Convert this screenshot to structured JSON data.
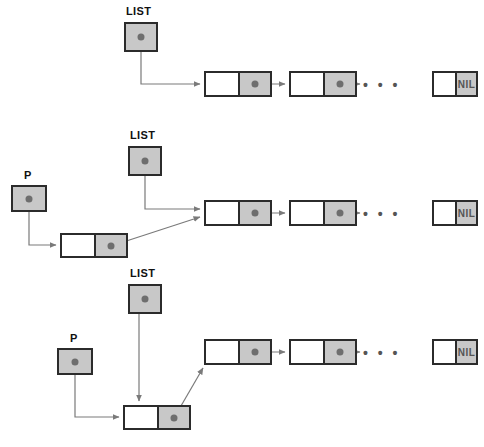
{
  "figure": {
    "caption": ""
  },
  "colors": {
    "box_fill_gray": "#c8c8c8",
    "box_fill_white": "#ffffff",
    "border": "#2b2b2b",
    "dot": "#6e6e6e",
    "arrow": "#7a7a7a",
    "nil_text": "#555555",
    "background": "#ffffff"
  },
  "labels": {
    "list": "LIST",
    "p": "P",
    "nil": "NIL",
    "ellipsis": "• • •"
  },
  "stages": [
    {
      "id": "stage-1",
      "name": "initial-list",
      "description": "LIST points to the first node of an existing chain; P does not exist yet.",
      "variables": [
        {
          "name": "LIST",
          "label": "LIST",
          "x": 124,
          "y": 22,
          "w": 34,
          "h": 30,
          "label_x": 126,
          "label_y": 5
        }
      ],
      "cells": [
        {
          "name": "chain-node-1",
          "x": 204,
          "y": 71,
          "w": 68,
          "h": 26,
          "link": "pointer"
        },
        {
          "name": "chain-node-2",
          "x": 289,
          "y": 71,
          "w": 68,
          "h": 26,
          "link": "pointer"
        },
        {
          "name": "chain-tail-nil",
          "x": 432,
          "y": 71,
          "w": 46,
          "h": 26,
          "link": "nil"
        }
      ],
      "ellipsis": {
        "x": 363,
        "y": 77
      }
    },
    {
      "id": "stage-2",
      "name": "new-node-allocated",
      "description": "P points to a newly allocated node whose link field points to the first node of the list; LIST still points to the first node.",
      "variables": [
        {
          "name": "LIST",
          "label": "LIST",
          "x": 128,
          "y": 146,
          "w": 34,
          "h": 30,
          "label_x": 130,
          "label_y": 129
        },
        {
          "name": "P",
          "label": "P",
          "x": 11,
          "y": 185,
          "w": 36,
          "h": 27,
          "label_x": 24,
          "label_y": 169
        }
      ],
      "cells": [
        {
          "name": "new-node",
          "x": 60,
          "y": 233,
          "w": 68,
          "h": 25,
          "link": "pointer"
        },
        {
          "name": "chain-node-1",
          "x": 204,
          "y": 200,
          "w": 68,
          "h": 26,
          "link": "pointer"
        },
        {
          "name": "chain-node-2",
          "x": 289,
          "y": 200,
          "w": 68,
          "h": 26,
          "link": "pointer"
        },
        {
          "name": "chain-tail-nil",
          "x": 432,
          "y": 200,
          "w": 46,
          "h": 26,
          "link": "nil"
        }
      ],
      "ellipsis": {
        "x": 363,
        "y": 206
      }
    },
    {
      "id": "stage-3",
      "name": "list-updated",
      "description": "LIST is reassigned to the new node, which becomes the head of the chain.",
      "variables": [
        {
          "name": "LIST",
          "label": "LIST",
          "x": 128,
          "y": 284,
          "w": 34,
          "h": 30,
          "label_x": 130,
          "label_y": 267
        },
        {
          "name": "P",
          "label": "P",
          "x": 57,
          "y": 348,
          "w": 36,
          "h": 27,
          "label_x": 70,
          "label_y": 332
        }
      ],
      "cells": [
        {
          "name": "new-head-node",
          "x": 123,
          "y": 405,
          "w": 68,
          "h": 25,
          "link": "pointer"
        },
        {
          "name": "chain-node-1",
          "x": 204,
          "y": 339,
          "w": 68,
          "h": 26,
          "link": "pointer"
        },
        {
          "name": "chain-node-2",
          "x": 289,
          "y": 339,
          "w": 68,
          "h": 26,
          "link": "pointer"
        },
        {
          "name": "chain-tail-nil",
          "x": 432,
          "y": 339,
          "w": 46,
          "h": 26,
          "link": "nil"
        }
      ],
      "ellipsis": {
        "x": 363,
        "y": 345
      }
    }
  ],
  "edges": [
    {
      "name": "stage1-list-to-node1",
      "stage": "stage-1",
      "from": "LIST",
      "to": "chain-node-1",
      "path": "M 141,52 L 141,84 L 200,84",
      "arrow": true
    },
    {
      "name": "stage1-node1-to-node2",
      "stage": "stage-1",
      "from": "chain-node-1",
      "to": "chain-node-2",
      "path": "M 238,84 L 285,84",
      "arrow": true
    },
    {
      "name": "stage1-node2-to-ellipsis",
      "stage": "stage-1",
      "from": "chain-node-2",
      "to": "ellipsis",
      "path": "M 323,84 L 360,84",
      "arrow": true
    },
    {
      "name": "stage2-list-to-node1",
      "stage": "stage-2",
      "from": "LIST",
      "to": "chain-node-1",
      "path": "M 145,176 L 145,209 L 200,209",
      "arrow": true
    },
    {
      "name": "stage2-p-to-newnode",
      "stage": "stage-2",
      "from": "P",
      "to": "new-node",
      "path": "M 29,212 L 29,245 L 56,245",
      "arrow": true
    },
    {
      "name": "stage2-newnode-to-node1",
      "stage": "stage-2",
      "from": "new-node",
      "to": "chain-node-1",
      "path": "M 111,246 L 200,217",
      "arrow": true
    },
    {
      "name": "stage2-node1-to-node2",
      "stage": "stage-2",
      "from": "chain-node-1",
      "to": "chain-node-2",
      "path": "M 238,213 L 285,213",
      "arrow": true
    },
    {
      "name": "stage2-node2-to-ellipsis",
      "stage": "stage-2",
      "from": "chain-node-2",
      "to": "ellipsis",
      "path": "M 323,213 L 360,213",
      "arrow": true
    },
    {
      "name": "stage3-list-to-newhead",
      "stage": "stage-3",
      "from": "LIST",
      "to": "new-head-node",
      "path": "M 139,314 L 139,401",
      "arrow": true
    },
    {
      "name": "stage3-p-to-newhead",
      "stage": "stage-3",
      "from": "P",
      "to": "new-head-node",
      "path": "M 75,375 L 75,417 L 119,417",
      "arrow": true
    },
    {
      "name": "stage3-newhead-to-node1",
      "stage": "stage-3",
      "from": "new-head-node",
      "to": "chain-node-1",
      "path": "M 174,418 L 203,368",
      "arrow": true
    },
    {
      "name": "stage3-node1-to-node2",
      "stage": "stage-3",
      "from": "chain-node-1",
      "to": "chain-node-2",
      "path": "M 238,352 L 285,352",
      "arrow": true
    },
    {
      "name": "stage3-node2-to-ellipsis",
      "stage": "stage-3",
      "from": "chain-node-2",
      "to": "ellipsis",
      "path": "M 323,352 L 360,352",
      "arrow": true
    }
  ]
}
